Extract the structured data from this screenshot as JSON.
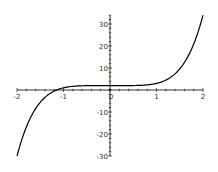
{
  "chart_data": {
    "type": "line",
    "title": "",
    "xlabel": "",
    "ylabel": "",
    "function": "y = x^5 + 2",
    "xlim": [
      -2,
      2
    ],
    "ylim": [
      -30,
      34
    ],
    "x_ticks": [
      -2,
      -1,
      0,
      1,
      2
    ],
    "x_tick_labels": [
      "-2",
      "-1",
      "0",
      "1",
      "2"
    ],
    "y_ticks": [
      -30,
      -20,
      -10,
      10,
      20,
      30
    ],
    "y_tick_labels": [
      "-30",
      "-20",
      "-10",
      "10",
      "20",
      "30"
    ],
    "grid": false,
    "legend": null,
    "series": [
      {
        "name": "curve",
        "color": "#000000",
        "x": [
          -2,
          -1.75,
          -1.5,
          -1.25,
          -1,
          -0.75,
          -0.5,
          -0.25,
          0,
          0.25,
          0.5,
          0.75,
          1,
          1.25,
          1.5,
          1.75,
          2
        ],
        "y": [
          -30,
          -14.4,
          -5.6,
          -1.05,
          1,
          1.76,
          1.97,
          2.0,
          2,
          2.0,
          2.03,
          2.24,
          3,
          5.05,
          9.6,
          18.4,
          34
        ]
      }
    ]
  },
  "colors": {
    "axis": "#000000",
    "curve": "#000000",
    "label": "#333333"
  }
}
